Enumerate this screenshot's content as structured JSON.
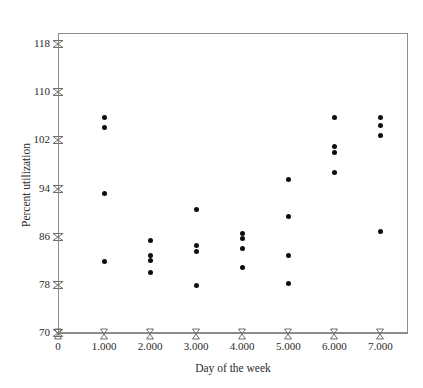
{
  "chart_data": {
    "type": "scatter",
    "title": "",
    "xlabel": "Day of the week",
    "ylabel": "Percent utilization",
    "xlim": [
      0,
      7.6
    ],
    "ylim": [
      70,
      120
    ],
    "grid": false,
    "legend": null,
    "xticks": [
      {
        "value": 0,
        "label": "0"
      },
      {
        "value": 1,
        "label": "1.000"
      },
      {
        "value": 2,
        "label": "2.000"
      },
      {
        "value": 3,
        "label": "3.000"
      },
      {
        "value": 4,
        "label": "4.000"
      },
      {
        "value": 5,
        "label": "5.000"
      },
      {
        "value": 6,
        "label": "6.000"
      },
      {
        "value": 7,
        "label": "7.000"
      }
    ],
    "yticks": [
      {
        "value": 70,
        "label": "70"
      },
      {
        "value": 78,
        "label": "78"
      },
      {
        "value": 86,
        "label": "86"
      },
      {
        "value": 94,
        "label": "94"
      },
      {
        "value": 102,
        "label": "102"
      },
      {
        "value": 110,
        "label": "110"
      },
      {
        "value": 118,
        "label": "118"
      }
    ],
    "marker": {
      "shape": "circle",
      "color": "#0d0d0d",
      "size": 5
    },
    "points": [
      {
        "x": 1,
        "y": 105.8
      },
      {
        "x": 1,
        "y": 104.2
      },
      {
        "x": 1,
        "y": 93.1
      },
      {
        "x": 1,
        "y": 81.8
      },
      {
        "x": 2,
        "y": 85.4
      },
      {
        "x": 2,
        "y": 82.9
      },
      {
        "x": 2,
        "y": 82.0
      },
      {
        "x": 2,
        "y": 80.1
      },
      {
        "x": 3,
        "y": 90.5
      },
      {
        "x": 3,
        "y": 84.6
      },
      {
        "x": 3,
        "y": 83.6
      },
      {
        "x": 3,
        "y": 77.9
      },
      {
        "x": 4,
        "y": 86.6
      },
      {
        "x": 4,
        "y": 85.7
      },
      {
        "x": 4,
        "y": 84.1
      },
      {
        "x": 4,
        "y": 80.9
      },
      {
        "x": 5,
        "y": 95.5
      },
      {
        "x": 5,
        "y": 89.4
      },
      {
        "x": 5,
        "y": 82.9
      },
      {
        "x": 5,
        "y": 78.2
      },
      {
        "x": 6,
        "y": 105.8
      },
      {
        "x": 6,
        "y": 101.0
      },
      {
        "x": 6,
        "y": 100.0
      },
      {
        "x": 6,
        "y": 96.7
      },
      {
        "x": 7,
        "y": 105.8
      },
      {
        "x": 7,
        "y": 104.4
      },
      {
        "x": 7,
        "y": 102.8
      },
      {
        "x": 7,
        "y": 86.8
      }
    ]
  },
  "axis": {
    "x_title": "Day of the week",
    "y_title": "Percent utilization"
  },
  "colors": {
    "marker": "#0d0d0d",
    "axis": "#8c8c8c",
    "text": "#2b2b2b",
    "background": "#ffffff"
  }
}
